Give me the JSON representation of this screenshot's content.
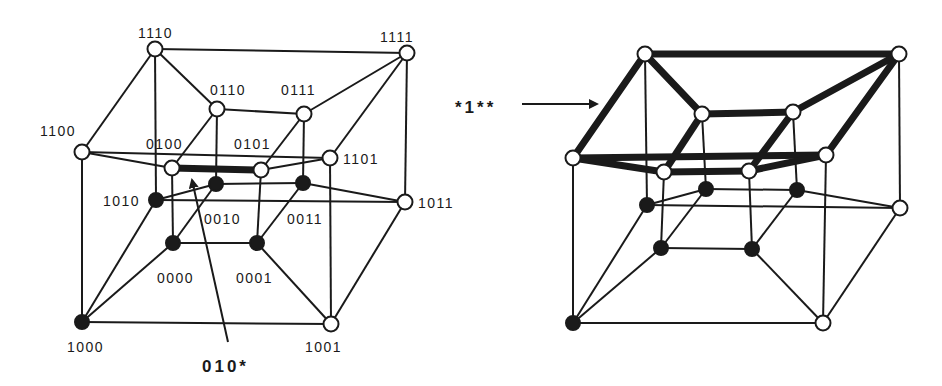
{
  "figure": {
    "left_panel": {
      "nodes": [
        {
          "id": "1110",
          "x": 155,
          "y": 49,
          "filled": false,
          "label": "1110",
          "lx": 138,
          "ly": 38
        },
        {
          "id": "1111",
          "x": 407,
          "y": 53,
          "filled": false,
          "label": "1111",
          "lx": 380,
          "ly": 42
        },
        {
          "id": "0110",
          "x": 217,
          "y": 109,
          "filled": false,
          "label": "0110",
          "lx": 210,
          "ly": 95
        },
        {
          "id": "0111",
          "x": 304,
          "y": 114,
          "filled": false,
          "label": "0111",
          "lx": 281,
          "ly": 95
        },
        {
          "id": "1100",
          "x": 82,
          "y": 152,
          "filled": false,
          "label": "1100",
          "lx": 40,
          "ly": 136
        },
        {
          "id": "0100",
          "x": 172,
          "y": 168,
          "filled": false,
          "label": "0100",
          "lx": 146,
          "ly": 149
        },
        {
          "id": "0101",
          "x": 261,
          "y": 170,
          "filled": false,
          "label": "0101",
          "lx": 234,
          "ly": 149
        },
        {
          "id": "1101",
          "x": 330,
          "y": 158,
          "filled": false,
          "label": "1101",
          "lx": 343,
          "ly": 164
        },
        {
          "id": "1010",
          "x": 156,
          "y": 200,
          "filled": true,
          "label": "1010",
          "lx": 103,
          "ly": 206
        },
        {
          "id": "0010",
          "x": 216,
          "y": 184,
          "filled": true,
          "label": "0010",
          "lx": 204,
          "ly": 224
        },
        {
          "id": "0011",
          "x": 303,
          "y": 183,
          "filled": true,
          "label": "0011",
          "lx": 287,
          "ly": 224
        },
        {
          "id": "1011",
          "x": 405,
          "y": 202,
          "filled": false,
          "label": "1011",
          "lx": 418,
          "ly": 208
        },
        {
          "id": "0000",
          "x": 173,
          "y": 243,
          "filled": true,
          "label": "0000",
          "lx": 157,
          "ly": 283
        },
        {
          "id": "0001",
          "x": 257,
          "y": 243,
          "filled": true,
          "label": "0001",
          "lx": 236,
          "ly": 283
        },
        {
          "id": "1000",
          "x": 82,
          "y": 322,
          "filled": true,
          "label": "1000",
          "lx": 67,
          "ly": 352
        },
        {
          "id": "1001",
          "x": 331,
          "y": 324,
          "filled": false,
          "label": "1001",
          "lx": 305,
          "ly": 352
        }
      ],
      "highlighted_edges": [
        [
          "0100",
          "0101"
        ]
      ],
      "annotation": {
        "text": "010*",
        "x": 202,
        "y": 372,
        "arrow_from": [
          228,
          342
        ],
        "arrow_to": [
          192,
          180
        ]
      }
    },
    "right_panel": {
      "nodes": [
        {
          "id": "1110",
          "x": 645,
          "y": 54,
          "filled": false
        },
        {
          "id": "1111",
          "x": 899,
          "y": 54,
          "filled": false
        },
        {
          "id": "0110",
          "x": 702,
          "y": 114,
          "filled": false
        },
        {
          "id": "0111",
          "x": 793,
          "y": 112,
          "filled": false
        },
        {
          "id": "1100",
          "x": 573,
          "y": 158,
          "filled": false
        },
        {
          "id": "0100",
          "x": 664,
          "y": 172,
          "filled": false
        },
        {
          "id": "0101",
          "x": 749,
          "y": 171,
          "filled": false
        },
        {
          "id": "1101",
          "x": 826,
          "y": 155,
          "filled": false
        },
        {
          "id": "1010",
          "x": 647,
          "y": 205,
          "filled": true
        },
        {
          "id": "0010",
          "x": 706,
          "y": 189,
          "filled": true
        },
        {
          "id": "0011",
          "x": 797,
          "y": 190,
          "filled": true
        },
        {
          "id": "1011",
          "x": 900,
          "y": 208,
          "filled": false
        },
        {
          "id": "0000",
          "x": 661,
          "y": 248,
          "filled": true
        },
        {
          "id": "0001",
          "x": 752,
          "y": 249,
          "filled": true
        },
        {
          "id": "1000",
          "x": 573,
          "y": 323,
          "filled": true
        },
        {
          "id": "1001",
          "x": 823,
          "y": 323,
          "filled": false
        }
      ],
      "highlighted_edges": [
        [
          "1110",
          "1111"
        ],
        [
          "1110",
          "0110"
        ],
        [
          "1110",
          "1100"
        ],
        [
          "1111",
          "0111"
        ],
        [
          "1111",
          "1101"
        ],
        [
          "0110",
          "0111"
        ],
        [
          "0110",
          "0100"
        ],
        [
          "0111",
          "0101"
        ],
        [
          "1100",
          "1101"
        ],
        [
          "1100",
          "0100"
        ],
        [
          "0100",
          "0101"
        ],
        [
          "0101",
          "1101"
        ]
      ],
      "annotation": {
        "text": "*1**",
        "x": 455,
        "y": 113,
        "arrow_from": [
          522,
          104
        ],
        "arrow_to": [
          597,
          104
        ]
      }
    },
    "edges": [
      [
        "1110",
        "1111"
      ],
      [
        "1110",
        "0110"
      ],
      [
        "1110",
        "1100"
      ],
      [
        "1110",
        "1010"
      ],
      [
        "1111",
        "0111"
      ],
      [
        "1111",
        "1101"
      ],
      [
        "1111",
        "1011"
      ],
      [
        "0110",
        "0111"
      ],
      [
        "0110",
        "0100"
      ],
      [
        "0110",
        "0010"
      ],
      [
        "0111",
        "0101"
      ],
      [
        "0111",
        "0011"
      ],
      [
        "1100",
        "1101"
      ],
      [
        "1100",
        "0100"
      ],
      [
        "1100",
        "1000"
      ],
      [
        "0100",
        "0101"
      ],
      [
        "0100",
        "0000"
      ],
      [
        "0101",
        "1101"
      ],
      [
        "0101",
        "0001"
      ],
      [
        "1101",
        "1001"
      ],
      [
        "1010",
        "0010"
      ],
      [
        "1010",
        "1011"
      ],
      [
        "1010",
        "1000"
      ],
      [
        "0010",
        "0011"
      ],
      [
        "0010",
        "0000"
      ],
      [
        "0011",
        "1011"
      ],
      [
        "0011",
        "0001"
      ],
      [
        "1011",
        "1001"
      ],
      [
        "0000",
        "0001"
      ],
      [
        "0000",
        "1000"
      ],
      [
        "0001",
        "1001"
      ],
      [
        "1000",
        "1001"
      ]
    ],
    "caption_left": "010*",
    "caption_right": "*1**"
  }
}
